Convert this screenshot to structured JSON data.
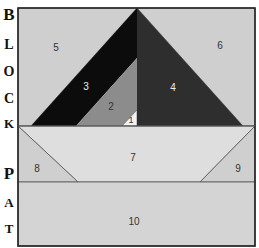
{
  "side_labels": {
    "block": [
      "B",
      "L",
      "O",
      "C",
      "K"
    ],
    "pat": [
      "P",
      "A",
      "T"
    ]
  },
  "pieces": [
    {
      "id": "1",
      "label": "1",
      "color": "#f2f2f2"
    },
    {
      "id": "2",
      "label": "2",
      "color": "#8c8c8c"
    },
    {
      "id": "3",
      "label": "3",
      "color": "#0c0c0c"
    },
    {
      "id": "4",
      "label": "4",
      "color": "#2e2e2e"
    },
    {
      "id": "5",
      "label": "5",
      "color": "#cfcfcf"
    },
    {
      "id": "6",
      "label": "6",
      "color": "#cfcfcf"
    },
    {
      "id": "7",
      "label": "7",
      "color": "#dedede"
    },
    {
      "id": "8",
      "label": "8",
      "color": "#cfcfcf"
    },
    {
      "id": "9",
      "label": "9",
      "color": "#cfcfcf"
    },
    {
      "id": "10",
      "label": "10",
      "color": "#d4d4d4"
    }
  ],
  "colors": {
    "frame": "#222222",
    "seam": "#555555"
  }
}
